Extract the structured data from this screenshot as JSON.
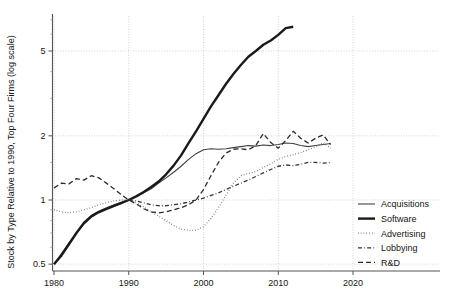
{
  "chart_data": {
    "type": "line",
    "title": "",
    "subtitle": "",
    "xlabel": "",
    "ylabel": "Stock by Type Relative to 1990, Top Four Firms (log scale)",
    "yscale": "log",
    "xlim": [
      1979,
      2021
    ],
    "ylim": [
      0.42,
      7.2
    ],
    "grid": true,
    "x_ticks": [
      1980,
      1990,
      2000,
      2010,
      2020
    ],
    "x_tick_labels": [
      "1980",
      "1990",
      "2000",
      "2010",
      "2020"
    ],
    "y_ticks": [
      0.5,
      1,
      2,
      5
    ],
    "y_tick_labels": [
      "0.5",
      "1",
      "2",
      "5"
    ],
    "legend_position": "right",
    "series": [
      {
        "name": "Acquisitions",
        "style": "solid",
        "width": 1.1,
        "color": "#404040",
        "x": [
          1980,
          1981,
          1982,
          1983,
          1984,
          1985,
          1986,
          1987,
          1988,
          1989,
          1990,
          1991,
          1992,
          1993,
          1994,
          1995,
          1996,
          1997,
          1998,
          1999,
          2000,
          2001,
          2002,
          2003,
          2004,
          2005,
          2006,
          2007,
          2008,
          2009,
          2010,
          2011,
          2012,
          2013,
          2014,
          2015,
          2016,
          2017
        ],
        "y": [
          0.5,
          0.56,
          0.63,
          0.7,
          0.77,
          0.83,
          0.87,
          0.9,
          0.93,
          0.96,
          1.0,
          1.04,
          1.08,
          1.13,
          1.2,
          1.27,
          1.35,
          1.44,
          1.55,
          1.65,
          1.72,
          1.74,
          1.73,
          1.74,
          1.76,
          1.78,
          1.8,
          1.79,
          1.81,
          1.8,
          1.82,
          1.85,
          1.84,
          1.8,
          1.78,
          1.8,
          1.82,
          1.84
        ]
      },
      {
        "name": "Software",
        "style": "solid",
        "width": 2.4,
        "color": "#1a1a1a",
        "x": [
          1980,
          1981,
          1982,
          1983,
          1984,
          1985,
          1986,
          1987,
          1988,
          1989,
          1990,
          1991,
          1992,
          1993,
          1994,
          1995,
          1996,
          1997,
          1998,
          1999,
          2000,
          2001,
          2002,
          2003,
          2004,
          2005,
          2006,
          2007,
          2008,
          2009,
          2010,
          2011,
          2012
        ],
        "y": [
          0.5,
          0.55,
          0.62,
          0.7,
          0.78,
          0.84,
          0.88,
          0.91,
          0.94,
          0.97,
          1.0,
          1.04,
          1.09,
          1.15,
          1.22,
          1.32,
          1.45,
          1.62,
          1.85,
          2.1,
          2.4,
          2.75,
          3.1,
          3.5,
          3.9,
          4.3,
          4.7,
          5.0,
          5.35,
          5.6,
          5.95,
          6.4,
          6.5
        ]
      },
      {
        "name": "Advertising",
        "style": "dotted",
        "width": 1.3,
        "color": "#4d4d4d",
        "x": [
          1980,
          1981,
          1982,
          1983,
          1984,
          1985,
          1986,
          1987,
          1988,
          1989,
          1990,
          1991,
          1992,
          1993,
          1994,
          1995,
          1996,
          1997,
          1998,
          1999,
          2000,
          2001,
          2002,
          2003,
          2004,
          2005,
          2006,
          2007,
          2008,
          2009,
          2010,
          2011,
          2012,
          2013,
          2014,
          2015,
          2016,
          2017
        ],
        "y": [
          0.9,
          0.88,
          0.87,
          0.88,
          0.9,
          0.92,
          0.95,
          0.97,
          0.99,
          1.0,
          1.0,
          0.97,
          0.93,
          0.88,
          0.84,
          0.8,
          0.76,
          0.73,
          0.72,
          0.72,
          0.75,
          0.82,
          0.92,
          1.05,
          1.2,
          1.3,
          1.33,
          1.36,
          1.42,
          1.48,
          1.55,
          1.6,
          1.63,
          1.67,
          1.72,
          1.78,
          1.86,
          1.75
        ]
      },
      {
        "name": "Lobbying",
        "style": "dashdot",
        "width": 1.3,
        "color": "#333333",
        "x": [
          1990,
          1991,
          1992,
          1993,
          1994,
          1995,
          1996,
          1997,
          1998,
          1999,
          2000,
          2001,
          2002,
          2003,
          2004,
          2005,
          2006,
          2007,
          2008,
          2009,
          2010,
          2011,
          2012,
          2013,
          2014,
          2015,
          2016,
          2017
        ],
        "y": [
          1.0,
          0.99,
          0.97,
          0.95,
          0.94,
          0.94,
          0.95,
          0.96,
          0.98,
          1.0,
          1.02,
          1.05,
          1.08,
          1.12,
          1.16,
          1.2,
          1.24,
          1.29,
          1.34,
          1.39,
          1.44,
          1.46,
          1.45,
          1.47,
          1.5,
          1.5,
          1.49,
          1.5
        ]
      },
      {
        "name": "R&D",
        "style": "dashed",
        "width": 1.3,
        "color": "#2b2b2b",
        "x": [
          1980,
          1981,
          1982,
          1983,
          1984,
          1985,
          1986,
          1987,
          1988,
          1989,
          1990,
          1991,
          1992,
          1993,
          1994,
          1995,
          1996,
          1997,
          1998,
          1999,
          2000,
          2001,
          2002,
          2003,
          2004,
          2005,
          2006,
          2007,
          2008,
          2009,
          2010,
          2011,
          2012,
          2013,
          2014,
          2015,
          2016,
          2017
        ],
        "y": [
          1.14,
          1.2,
          1.19,
          1.26,
          1.24,
          1.3,
          1.27,
          1.2,
          1.13,
          1.06,
          1.0,
          0.96,
          0.91,
          0.88,
          0.87,
          0.88,
          0.9,
          0.92,
          0.95,
          1.0,
          1.12,
          1.3,
          1.5,
          1.66,
          1.73,
          1.74,
          1.72,
          1.8,
          2.05,
          1.86,
          1.75,
          1.9,
          2.1,
          1.95,
          1.85,
          1.95,
          2.02,
          1.82
        ]
      }
    ]
  },
  "legend": {
    "items": [
      {
        "label": "Acquisitions"
      },
      {
        "label": "Software"
      },
      {
        "label": "Advertising"
      },
      {
        "label": "Lobbying"
      },
      {
        "label": "R&D"
      }
    ]
  }
}
